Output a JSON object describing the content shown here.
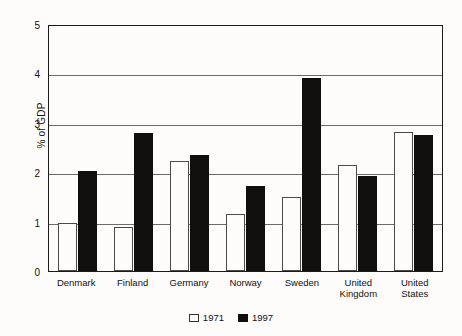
{
  "chart_data": {
    "type": "bar",
    "title": "",
    "xlabel": "",
    "ylabel": "% of GDP",
    "ylim": [
      0,
      5
    ],
    "yticks": [
      "0",
      "1",
      "2",
      "3",
      "4",
      "5"
    ],
    "grid": true,
    "legend_position": "bottom-center",
    "categories": [
      "Denmark",
      "Finland",
      "Germany",
      "Norway",
      "Sweden",
      "United Kingdom",
      "United States"
    ],
    "series": [
      {
        "name": "1971",
        "color": "#ffffff",
        "values": [
          0.97,
          0.9,
          2.22,
          1.15,
          1.5,
          2.15,
          2.82
        ]
      },
      {
        "name": "1997",
        "color": "#100f0d",
        "values": [
          2.03,
          2.8,
          2.35,
          1.72,
          3.9,
          1.92,
          2.75
        ]
      }
    ]
  },
  "axis": {
    "y_title": "% of GDP"
  },
  "legend": {
    "entries": [
      {
        "label": "1971",
        "swatch": "white-square-icon"
      },
      {
        "label": "1997",
        "swatch": "black-square-icon"
      }
    ]
  }
}
